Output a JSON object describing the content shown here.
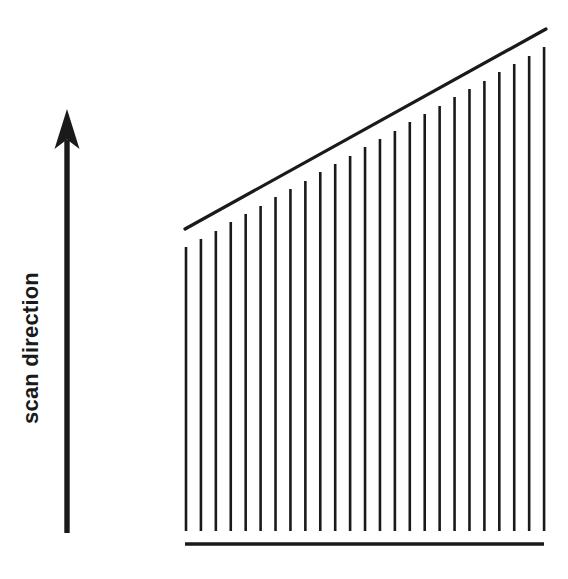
{
  "figure": {
    "background_color": "#ffffff",
    "ink_color": "#1a1a1a",
    "width": 568,
    "height": 579
  },
  "axis_label": {
    "text": "scan direction",
    "rotation_deg": -90,
    "font_size": 22,
    "font_weight": "bold",
    "center_x": 30,
    "center_y": 348,
    "color": "#1a1a1a"
  },
  "arrow": {
    "name": "scan-direction-arrow",
    "direction": "up",
    "shaft_x": 67,
    "tip_y": 109,
    "tail_y": 533,
    "shaft_width": 5.4,
    "head_width": 25,
    "head_height": 40,
    "color": "#1a1a1a"
  },
  "baseline": {
    "name": "baseline",
    "x1": 185,
    "x2": 544,
    "y": 544,
    "stroke_width": 3.6,
    "color": "#1a1a1a"
  },
  "envelope": {
    "name": "ramp-envelope-diagonal",
    "x1": 185,
    "y1": 229,
    "x2": 546,
    "y2": 29,
    "stroke_width": 3.2,
    "color": "#1a1a1a"
  },
  "chart_data": {
    "type": "bar",
    "title": "scan direction",
    "xlabel": "",
    "ylabel": "scan direction",
    "grid": false,
    "legend": false,
    "orientation": "vertical",
    "baseline_y": 531,
    "bar_stroke_width": 2.6,
    "bar_color": "#1a1a1a",
    "bar_count": 25,
    "first_bar_x": 186,
    "bar_spacing": 14.92,
    "categories": [
      "1",
      "2",
      "3",
      "4",
      "5",
      "6",
      "7",
      "8",
      "9",
      "10",
      "11",
      "12",
      "13",
      "14",
      "15",
      "16",
      "17",
      "18",
      "19",
      "20",
      "21",
      "22",
      "23",
      "24",
      "25"
    ],
    "tops_y": [
      247,
      239,
      231,
      222,
      214,
      206,
      197,
      189,
      181,
      172,
      164,
      156,
      147,
      139,
      131,
      122,
      114,
      106,
      97,
      89,
      81,
      72,
      64,
      56,
      47
    ],
    "values": [
      284,
      292,
      300,
      309,
      317,
      325,
      334,
      342,
      350,
      359,
      367,
      375,
      384,
      392,
      400,
      409,
      417,
      425,
      434,
      442,
      450,
      459,
      467,
      475,
      484
    ],
    "ylim": [
      0,
      502
    ],
    "xlim": [
      178,
      552
    ]
  }
}
